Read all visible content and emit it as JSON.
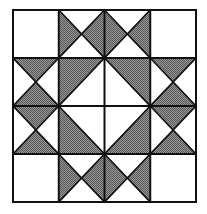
{
  "diagram": {
    "type": "quilt-block",
    "grid": {
      "cols": 4,
      "rows": 4
    },
    "bounds": {
      "x": 13,
      "y": 10,
      "width": 183,
      "height": 192
    },
    "colors": {
      "line": "#111111",
      "shade": "#7a7a7a",
      "background": "#ffffff"
    },
    "cells": [
      {
        "r": 0,
        "c": 0,
        "kind": "plain"
      },
      {
        "r": 0,
        "c": 1,
        "kind": "hourglass",
        "shaded": [
          "left",
          "right"
        ]
      },
      {
        "r": 0,
        "c": 2,
        "kind": "hourglass",
        "shaded": [
          "left",
          "right"
        ]
      },
      {
        "r": 0,
        "c": 3,
        "kind": "plain"
      },
      {
        "r": 1,
        "c": 0,
        "kind": "hourglass",
        "shaded": [
          "top",
          "bottom"
        ]
      },
      {
        "r": 1,
        "c": 1,
        "kind": "half",
        "shaded": "top-left"
      },
      {
        "r": 1,
        "c": 2,
        "kind": "half",
        "shaded": "top-right"
      },
      {
        "r": 1,
        "c": 3,
        "kind": "hourglass",
        "shaded": [
          "top",
          "bottom"
        ]
      },
      {
        "r": 2,
        "c": 0,
        "kind": "hourglass",
        "shaded": [
          "top",
          "bottom"
        ]
      },
      {
        "r": 2,
        "c": 1,
        "kind": "half",
        "shaded": "bottom-left"
      },
      {
        "r": 2,
        "c": 2,
        "kind": "half",
        "shaded": "bottom-right"
      },
      {
        "r": 2,
        "c": 3,
        "kind": "hourglass",
        "shaded": [
          "top",
          "bottom"
        ]
      },
      {
        "r": 3,
        "c": 0,
        "kind": "plain"
      },
      {
        "r": 3,
        "c": 1,
        "kind": "hourglass",
        "shaded": [
          "left",
          "right"
        ]
      },
      {
        "r": 3,
        "c": 2,
        "kind": "hourglass",
        "shaded": [
          "left",
          "right"
        ]
      },
      {
        "r": 3,
        "c": 3,
        "kind": "plain"
      }
    ]
  }
}
